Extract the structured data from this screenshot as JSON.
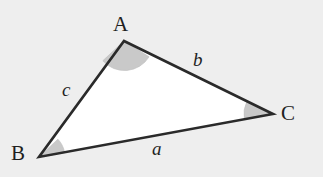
{
  "figure": {
    "kind": "geometry-diagram",
    "background_color": "#eeeeee",
    "interior_fill": "#ffffff",
    "stroke_color": "#2a2a2a",
    "stroke_width": 2.6,
    "angle_arc_fill": "#c9c9c9",
    "angle_arc_stroke": "#bdbdbd"
  },
  "vertices": [
    {
      "id": "A",
      "label": "A",
      "x": 124,
      "y": 41,
      "arc_radius": 29
    },
    {
      "id": "B",
      "label": "B",
      "x": 39,
      "y": 157,
      "arc_radius": 26
    },
    {
      "id": "C",
      "label": "C",
      "x": 273,
      "y": 114,
      "arc_radius": 29
    }
  ],
  "sides": [
    {
      "id": "a",
      "label": "a",
      "from": "B",
      "to": "C",
      "opposite_vertex": "A"
    },
    {
      "id": "b",
      "label": "b",
      "from": "A",
      "to": "C",
      "opposite_vertex": "B"
    },
    {
      "id": "c",
      "label": "c",
      "from": "A",
      "to": "B",
      "opposite_vertex": "C"
    }
  ]
}
